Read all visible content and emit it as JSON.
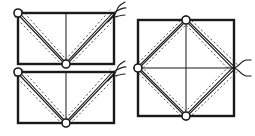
{
  "figure": {
    "background_color": "#ffffff",
    "stroke_color": "#1a1a1a",
    "dash_color": "#333333",
    "canvas": {
      "width": 255,
      "height": 136
    }
  },
  "panels": [
    {
      "id": "panel-top-left",
      "name": "rectangle-v-routing-top",
      "shape": "rectangle",
      "x": 18,
      "y": 13,
      "width": 96,
      "height": 51,
      "center_line": {
        "type": "vertical",
        "x": 66
      },
      "cable_path": "V-shape from top-left corner to bottom-center to top-right corner",
      "rings": [
        {
          "name": "ring-top-left",
          "cx": 18,
          "cy": 13,
          "r": 4
        },
        {
          "name": "ring-bottom-center",
          "cx": 66,
          "cy": 64,
          "r": 4
        }
      ],
      "squiggles": [
        {
          "name": "squiggle-top-right",
          "x": 114,
          "y": 13
        }
      ]
    },
    {
      "id": "panel-bottom-left",
      "name": "rectangle-v-routing-bottom",
      "shape": "rectangle",
      "x": 18,
      "y": 72,
      "width": 96,
      "height": 51,
      "center_line": {
        "type": "vertical",
        "x": 66
      },
      "cable_path": "V-shape from top-left corner to bottom-center to top-right corner",
      "rings": [
        {
          "name": "ring-top-left",
          "cx": 18,
          "cy": 72,
          "r": 4
        },
        {
          "name": "ring-bottom-center",
          "cx": 66,
          "cy": 123,
          "r": 4
        }
      ],
      "squiggles": [
        {
          "name": "squiggle-top-right",
          "x": 114,
          "y": 72
        }
      ]
    },
    {
      "id": "panel-right",
      "name": "square-diamond-routing",
      "shape": "square",
      "x": 138,
      "y": 20,
      "width": 96,
      "height": 96,
      "center_line": {
        "type": "cross",
        "x": 186,
        "y": 68
      },
      "cable_path": "Diamond connecting midpoints of all four square edges",
      "rings": [
        {
          "name": "ring-top-mid",
          "cx": 186,
          "cy": 20,
          "r": 4
        },
        {
          "name": "ring-bottom-mid",
          "cx": 186,
          "cy": 116,
          "r": 4
        },
        {
          "name": "ring-left-mid",
          "cx": 138,
          "cy": 68,
          "r": 4
        }
      ],
      "squiggles": [
        {
          "name": "fork-right-mid",
          "x": 234,
          "y": 68
        }
      ]
    }
  ],
  "line_styles": {
    "outline_width": 2.4,
    "center_line_width": 1.0,
    "cable_width": 1.1,
    "cable_gap": 2.2,
    "dash_pattern": "2.2 2.2",
    "dash_offset": 5.0,
    "ring_stroke_width": 1.6
  }
}
